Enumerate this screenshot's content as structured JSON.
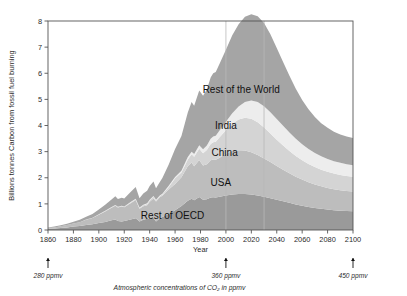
{
  "chart_data": {
    "type": "area",
    "stacked": true,
    "title": "",
    "xlabel": "Year",
    "ylabel": "Billions tonnes Carbon from fossil fuel burning",
    "xlim": [
      1860,
      2100
    ],
    "ylim": [
      0,
      8
    ],
    "xticks": [
      1860,
      1880,
      1900,
      1920,
      1940,
      1960,
      1980,
      2000,
      2020,
      2040,
      2060,
      2080,
      2100
    ],
    "yticks": [
      0,
      1,
      2,
      3,
      4,
      5,
      6,
      7,
      8
    ],
    "grid": "vertical-only",
    "gridlines_x": [
      2000,
      2030
    ],
    "legend_position": "inline-labels",
    "colors": {
      "rest_of_oecd": "#9a9a9a",
      "usa": "#bdbdbd",
      "china": "#d4d4d4",
      "india": "#ededed",
      "rest_of_the_world": "#a5a5a5",
      "frame": "#555555",
      "gridline": "#b9b9b9"
    },
    "x": [
      1860,
      1865,
      1870,
      1875,
      1880,
      1885,
      1890,
      1895,
      1900,
      1905,
      1910,
      1913,
      1915,
      1918,
      1920,
      1925,
      1929,
      1932,
      1935,
      1938,
      1940,
      1943,
      1945,
      1948,
      1950,
      1955,
      1960,
      1965,
      1970,
      1973,
      1975,
      1979,
      1982,
      1985,
      1988,
      1990,
      1992,
      1995,
      2000,
      2005,
      2010,
      2015,
      2020,
      2025,
      2030,
      2035,
      2040,
      2045,
      2050,
      2055,
      2060,
      2065,
      2070,
      2075,
      2080,
      2085,
      2090,
      2095,
      2100
    ],
    "series": [
      {
        "name": "Rest of OECD",
        "label": "Rest  of OECD",
        "label_xy": [
          1958,
          0.42
        ],
        "values": [
          0.05,
          0.06,
          0.08,
          0.1,
          0.13,
          0.15,
          0.19,
          0.22,
          0.27,
          0.31,
          0.37,
          0.4,
          0.34,
          0.33,
          0.34,
          0.4,
          0.45,
          0.33,
          0.39,
          0.43,
          0.45,
          0.47,
          0.33,
          0.45,
          0.5,
          0.62,
          0.76,
          0.92,
          1.12,
          1.2,
          1.14,
          1.26,
          1.16,
          1.18,
          1.24,
          1.25,
          1.24,
          1.27,
          1.32,
          1.36,
          1.38,
          1.38,
          1.36,
          1.32,
          1.27,
          1.22,
          1.16,
          1.1,
          1.04,
          0.98,
          0.93,
          0.88,
          0.84,
          0.81,
          0.78,
          0.76,
          0.74,
          0.73,
          0.72
        ]
      },
      {
        "name": "USA",
        "label": "USA",
        "label_xy": [
          1996,
          1.68
        ],
        "values": [
          0.03,
          0.04,
          0.06,
          0.09,
          0.12,
          0.15,
          0.2,
          0.24,
          0.31,
          0.4,
          0.48,
          0.53,
          0.52,
          0.57,
          0.53,
          0.62,
          0.7,
          0.48,
          0.52,
          0.52,
          0.63,
          0.74,
          0.76,
          0.8,
          0.81,
          0.93,
          1.0,
          1.1,
          1.32,
          1.38,
          1.3,
          1.42,
          1.31,
          1.34,
          1.43,
          1.45,
          1.45,
          1.5,
          1.6,
          1.66,
          1.67,
          1.66,
          1.62,
          1.55,
          1.47,
          1.38,
          1.29,
          1.21,
          1.13,
          1.06,
          1.0,
          0.95,
          0.9,
          0.86,
          0.83,
          0.8,
          0.78,
          0.76,
          0.75
        ]
      },
      {
        "name": "China",
        "label": "China",
        "label_xy": [
          1999,
          2.85
        ],
        "values": [
          0.0,
          0.0,
          0.0,
          0.0,
          0.0,
          0.0,
          0.01,
          0.01,
          0.01,
          0.02,
          0.02,
          0.02,
          0.02,
          0.02,
          0.02,
          0.03,
          0.03,
          0.03,
          0.04,
          0.05,
          0.05,
          0.06,
          0.04,
          0.04,
          0.05,
          0.1,
          0.22,
          0.18,
          0.26,
          0.32,
          0.36,
          0.43,
          0.47,
          0.54,
          0.62,
          0.66,
          0.69,
          0.78,
          0.9,
          1.05,
          1.18,
          1.26,
          1.28,
          1.25,
          1.18,
          1.09,
          1.0,
          0.92,
          0.85,
          0.79,
          0.74,
          0.7,
          0.67,
          0.64,
          0.62,
          0.6,
          0.59,
          0.58,
          0.57
        ]
      },
      {
        "name": "India",
        "label": "India",
        "label_xy": [
          2000,
          3.85
        ],
        "values": [
          0.0,
          0.0,
          0.0,
          0.0,
          0.0,
          0.0,
          0.0,
          0.0,
          0.01,
          0.01,
          0.01,
          0.01,
          0.01,
          0.01,
          0.01,
          0.02,
          0.02,
          0.02,
          0.02,
          0.02,
          0.03,
          0.03,
          0.03,
          0.03,
          0.03,
          0.04,
          0.05,
          0.07,
          0.09,
          0.1,
          0.11,
          0.13,
          0.15,
          0.17,
          0.2,
          0.22,
          0.23,
          0.26,
          0.32,
          0.4,
          0.5,
          0.6,
          0.7,
          0.78,
          0.82,
          0.82,
          0.8,
          0.76,
          0.71,
          0.66,
          0.61,
          0.57,
          0.54,
          0.51,
          0.49,
          0.47,
          0.46,
          0.45,
          0.44
        ]
      },
      {
        "name": "Rest of the World",
        "label": "Rest  of the World",
        "label_xy": [
          2012,
          5.25
        ],
        "values": [
          0.02,
          0.03,
          0.04,
          0.05,
          0.07,
          0.09,
          0.11,
          0.14,
          0.18,
          0.23,
          0.29,
          0.33,
          0.3,
          0.3,
          0.31,
          0.38,
          0.45,
          0.36,
          0.43,
          0.48,
          0.52,
          0.56,
          0.44,
          0.52,
          0.6,
          0.82,
          1.07,
          1.33,
          1.71,
          1.9,
          1.85,
          2.1,
          2.05,
          2.15,
          2.35,
          2.42,
          2.44,
          2.55,
          2.76,
          2.98,
          3.15,
          3.26,
          3.3,
          3.28,
          3.18,
          2.98,
          2.72,
          2.44,
          2.17,
          1.92,
          1.7,
          1.52,
          1.38,
          1.27,
          1.19,
          1.13,
          1.09,
          1.06,
          1.04
        ]
      }
    ],
    "annotations": [
      {
        "id": "ppmv-1860",
        "text": "280 ppmv",
        "x": 1860,
        "arrow": true
      },
      {
        "id": "ppmv-2000",
        "text": "360 ppmv",
        "x": 2000,
        "arrow": true
      },
      {
        "id": "ppmv-2100",
        "text": "450 ppmv",
        "x": 2100,
        "arrow": true
      }
    ],
    "caption": "Atmospheric concentrations of CO₂ in ppmv",
    "caption_plain": "Atmospheric concentrations of CO2 in ppmv"
  }
}
